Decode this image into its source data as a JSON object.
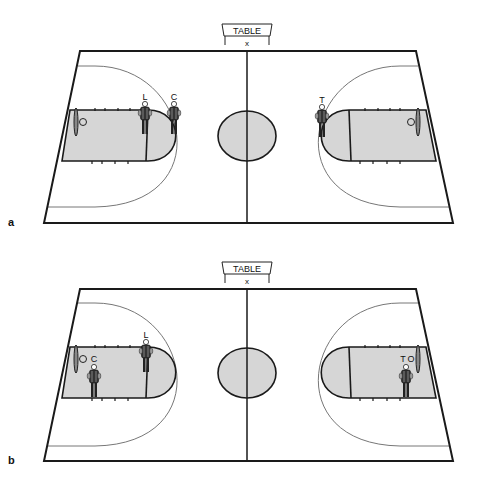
{
  "figure": {
    "panels": [
      {
        "id": "a",
        "label": "a",
        "table_label": "TABLE",
        "table_mark": "x",
        "referees": [
          {
            "label": "L",
            "x": 145,
            "y": 100
          },
          {
            "label": "C",
            "x": 174,
            "y": 100
          },
          {
            "label": "T",
            "x": 322,
            "y": 100
          }
        ]
      },
      {
        "id": "b",
        "label": "b",
        "table_label": "TABLE",
        "table_mark": "x",
        "referees": [
          {
            "label": "L",
            "x": 146,
            "y": 338
          },
          {
            "label": "C",
            "x": 94,
            "y": 362
          },
          {
            "label": "T",
            "x": 406,
            "y": 362
          }
        ],
        "extra_label": "O"
      }
    ]
  },
  "colors": {
    "line": "#1a1a1a",
    "arc": "#777777",
    "fill": "#d6d6d6"
  }
}
